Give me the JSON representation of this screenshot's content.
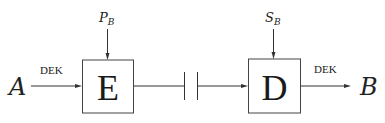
{
  "diagram": {
    "source_node": {
      "label": "A"
    },
    "sink_node": {
      "label": "B"
    },
    "encrypt_block": {
      "label": "E",
      "key_input": {
        "main": "P",
        "subscript": "B"
      }
    },
    "decrypt_block": {
      "label": "D",
      "key_input": {
        "main": "S",
        "subscript": "B"
      }
    },
    "input_edge_label": "DEK",
    "output_edge_label": "DEK",
    "channel": {
      "symbol": "break",
      "description": "communication channel"
    }
  }
}
